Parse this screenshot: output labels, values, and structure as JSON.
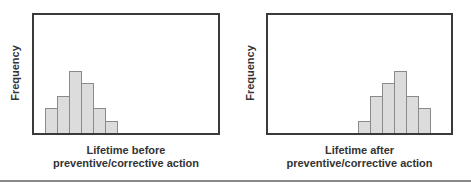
{
  "chart_data": [
    {
      "type": "bar",
      "title": "",
      "xlabel": "Lifetime before preventive/corrective action",
      "xlabel_lines": [
        "Lifetime before",
        "preventive/corrective action"
      ],
      "ylabel": "Frequency",
      "categories": [
        "1",
        "2",
        "3",
        "4",
        "5",
        "6"
      ],
      "values": [
        2,
        3,
        5,
        4,
        2,
        1
      ],
      "bin_start_fraction": 0.06,
      "grid": false,
      "ticks": false
    },
    {
      "type": "bar",
      "title": "",
      "xlabel": "Lifetime after preventive/corrective action",
      "xlabel_lines": [
        "Lifetime after",
        "preventive/corrective action"
      ],
      "ylabel": "Frequency",
      "categories": [
        "1",
        "2",
        "3",
        "4",
        "5",
        "6"
      ],
      "values": [
        1,
        3,
        4,
        5,
        3,
        2
      ],
      "bin_start_fraction": 0.49,
      "grid": false,
      "ticks": false
    }
  ],
  "colors": {
    "frame": "#3a3a3a",
    "bar_fill": "#dcdcdc",
    "bar_border": "#8a8a8a",
    "rule": "#888888"
  },
  "left": {
    "ylabel": "Frequency",
    "xlabel_line1": "Lifetime before",
    "xlabel_line2": "preventive/corrective action"
  },
  "right": {
    "ylabel": "Frequency",
    "xlabel_line1": "Lifetime after",
    "xlabel_line2": "preventive/corrective action"
  }
}
